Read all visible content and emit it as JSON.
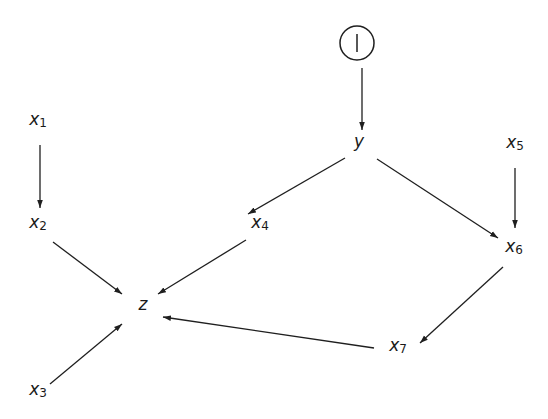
{
  "diagram": {
    "title": "",
    "nodes": [
      {
        "id": "I",
        "label": "I",
        "sub": "",
        "x": 357,
        "y": 23,
        "shape": "circle"
      },
      {
        "id": "y",
        "label": "y",
        "sub": "",
        "x": 359,
        "y": 147,
        "shape": "text"
      },
      {
        "id": "x1",
        "label": "x",
        "sub": "1",
        "x": 38,
        "y": 125,
        "shape": "text"
      },
      {
        "id": "x2",
        "label": "x",
        "sub": "2",
        "x": 38,
        "y": 228,
        "shape": "text"
      },
      {
        "id": "x3",
        "label": "x",
        "sub": "3",
        "x": 38,
        "y": 395,
        "shape": "text"
      },
      {
        "id": "x4",
        "label": "x",
        "sub": "4",
        "x": 260,
        "y": 228,
        "shape": "text"
      },
      {
        "id": "x5",
        "label": "x",
        "sub": "5",
        "x": 515,
        "y": 148,
        "shape": "text"
      },
      {
        "id": "x6",
        "label": "x",
        "sub": "6",
        "x": 514,
        "y": 252,
        "shape": "text"
      },
      {
        "id": "x7",
        "label": "x",
        "sub": "7",
        "x": 398,
        "y": 351,
        "shape": "text"
      },
      {
        "id": "z",
        "label": "z",
        "sub": "",
        "x": 143,
        "y": 310,
        "shape": "text"
      }
    ],
    "edges": [
      {
        "from": "I",
        "to": "y",
        "x1": 362,
        "y1": 68,
        "x2": 362,
        "y2": 130
      },
      {
        "from": "y",
        "to": "x4",
        "x1": 345,
        "y1": 158,
        "x2": 248,
        "y2": 214
      },
      {
        "from": "y",
        "to": "x6",
        "x1": 377,
        "y1": 159,
        "x2": 498,
        "y2": 238
      },
      {
        "from": "x1",
        "to": "x2",
        "x1": 40,
        "y1": 145,
        "x2": 40,
        "y2": 208
      },
      {
        "from": "x5",
        "to": "x6",
        "x1": 515,
        "y1": 168,
        "x2": 515,
        "y2": 228
      },
      {
        "from": "x2",
        "to": "z",
        "x1": 53,
        "y1": 242,
        "x2": 122,
        "y2": 294
      },
      {
        "from": "x4",
        "to": "z",
        "x1": 246,
        "y1": 240,
        "x2": 158,
        "y2": 294
      },
      {
        "from": "x3",
        "to": "z",
        "x1": 50,
        "y1": 384,
        "x2": 122,
        "y2": 324
      },
      {
        "from": "x6",
        "to": "x7",
        "x1": 503,
        "y1": 267,
        "x2": 420,
        "y2": 343
      },
      {
        "from": "x7",
        "to": "z",
        "x1": 374,
        "y1": 348,
        "x2": 163,
        "y2": 317
      }
    ]
  }
}
